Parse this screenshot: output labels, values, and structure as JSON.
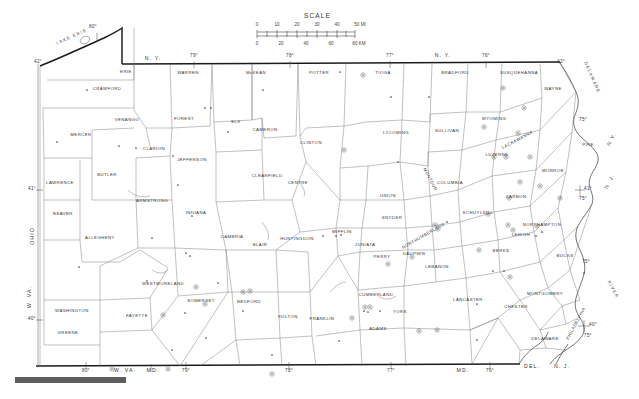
{
  "map": {
    "title": "Pennsylvania County Map",
    "region": "Pennsylvania",
    "scale": {
      "label": "SCALE",
      "miles_ticks": [
        "0",
        "10",
        "20",
        "30",
        "40",
        "50 MI"
      ],
      "km_ticks": [
        "0",
        "20",
        "40",
        "60",
        "80 KM"
      ]
    },
    "water_labels": [
      {
        "name": "LAKE ERIE",
        "x": 72,
        "y": 38,
        "rotate": -24
      },
      {
        "name": "DELAWARE",
        "x": 591,
        "y": 78,
        "rotate": 66
      },
      {
        "name": "RIVER",
        "x": 612,
        "y": 290,
        "rotate": 62
      }
    ],
    "state_labels": [
      {
        "name": "N. Y.",
        "x": 153,
        "y": 60
      },
      {
        "name": "N. Y.",
        "x": 443,
        "y": 57
      },
      {
        "name": "OHIO",
        "x": 34,
        "y": 236,
        "rotate": -90
      },
      {
        "name": "W. VA.",
        "x": 31,
        "y": 297,
        "rotate": -90
      },
      {
        "name": "W. VA.",
        "x": 125,
        "y": 372
      },
      {
        "name": "MD.",
        "x": 153,
        "y": 372
      },
      {
        "name": "MD.",
        "x": 463,
        "y": 372
      },
      {
        "name": "DEL.",
        "x": 532,
        "y": 368
      },
      {
        "name": "N. J.",
        "x": 562,
        "y": 368
      },
      {
        "name": "N.Y.",
        "x": 613,
        "y": 140,
        "rotate": -62
      },
      {
        "name": "N. J.",
        "x": 611,
        "y": 182,
        "rotate": -62
      }
    ],
    "coordinate_labels": [
      {
        "text": "80°",
        "x": 93,
        "y": 28
      },
      {
        "text": "42°",
        "x": 38,
        "y": 63
      },
      {
        "text": "79°",
        "x": 194,
        "y": 57
      },
      {
        "text": "78°",
        "x": 290,
        "y": 57
      },
      {
        "text": "77°",
        "x": 390,
        "y": 57
      },
      {
        "text": "76°",
        "x": 486,
        "y": 57
      },
      {
        "text": "42°",
        "x": 561,
        "y": 63
      },
      {
        "text": "75°",
        "x": 583,
        "y": 121
      },
      {
        "text": "41°",
        "x": 32,
        "y": 190
      },
      {
        "text": "41°",
        "x": 588,
        "y": 190
      },
      {
        "text": "75°",
        "x": 583,
        "y": 200
      },
      {
        "text": "75°",
        "x": 586,
        "y": 263
      },
      {
        "text": "40°",
        "x": 32,
        "y": 320
      },
      {
        "text": "40°",
        "x": 593,
        "y": 326
      },
      {
        "text": "75°",
        "x": 588,
        "y": 337
      },
      {
        "text": "80°",
        "x": 86,
        "y": 372
      },
      {
        "text": "79°",
        "x": 186,
        "y": 372
      },
      {
        "text": "78°",
        "x": 289,
        "y": 372
      },
      {
        "text": "77°",
        "x": 391,
        "y": 372
      },
      {
        "text": "76°",
        "x": 490,
        "y": 372
      }
    ],
    "counties": [
      {
        "name": "ERIE",
        "x": 126,
        "y": 73
      },
      {
        "name": "CRAWFORD",
        "x": 107,
        "y": 90
      },
      {
        "name": "WARREN",
        "x": 188,
        "y": 74
      },
      {
        "name": "McKEAN",
        "x": 256,
        "y": 74
      },
      {
        "name": "POTTER",
        "x": 319,
        "y": 74
      },
      {
        "name": "TIOGA",
        "x": 383,
        "y": 74
      },
      {
        "name": "BRADFORD",
        "x": 455,
        "y": 74
      },
      {
        "name": "SUSQUEHANNA",
        "x": 519,
        "y": 74
      },
      {
        "name": "WAYNE",
        "x": 553,
        "y": 90
      },
      {
        "name": "VENANGO",
        "x": 127,
        "y": 121
      },
      {
        "name": "FOREST",
        "x": 184,
        "y": 120
      },
      {
        "name": "ELK",
        "x": 236,
        "y": 123
      },
      {
        "name": "CAMERON",
        "x": 265,
        "y": 131
      },
      {
        "name": "CLINTON",
        "x": 311,
        "y": 144
      },
      {
        "name": "LYCOMING",
        "x": 396,
        "y": 134
      },
      {
        "name": "SULLIVAN",
        "x": 447,
        "y": 132
      },
      {
        "name": "WYOMING",
        "x": 494,
        "y": 120
      },
      {
        "name": "LACKAWANNA",
        "x": 518,
        "y": 141,
        "rotate": -28
      },
      {
        "name": "PIKE",
        "x": 588,
        "y": 146
      },
      {
        "name": "MERCER",
        "x": 81,
        "y": 136
      },
      {
        "name": "CLARION",
        "x": 154,
        "y": 150
      },
      {
        "name": "JEFFERSON",
        "x": 192,
        "y": 161
      },
      {
        "name": "CLEARFIELD",
        "x": 267,
        "y": 177
      },
      {
        "name": "CENTRE",
        "x": 298,
        "y": 184
      },
      {
        "name": "COLUMBIA",
        "x": 450,
        "y": 184
      },
      {
        "name": "LUZERNE",
        "x": 497,
        "y": 156
      },
      {
        "name": "MONROE",
        "x": 553,
        "y": 172
      },
      {
        "name": "LAWRENCE",
        "x": 60,
        "y": 184
      },
      {
        "name": "BUTLER",
        "x": 107,
        "y": 176
      },
      {
        "name": "ARMSTRONG",
        "x": 152,
        "y": 202
      },
      {
        "name": "INDIANA",
        "x": 196,
        "y": 214
      },
      {
        "name": "UNION",
        "x": 388,
        "y": 197
      },
      {
        "name": "SNYDER",
        "x": 392,
        "y": 219
      },
      {
        "name": "MONTOUR",
        "x": 429,
        "y": 180,
        "rotate": 62
      },
      {
        "name": "NORTHUMBERLAND",
        "x": 424,
        "y": 237,
        "rotate": -30
      },
      {
        "name": "SCHUYLKILL",
        "x": 478,
        "y": 214
      },
      {
        "name": "CARBON",
        "x": 516,
        "y": 198
      },
      {
        "name": "NORTHAMPTON",
        "x": 542,
        "y": 226
      },
      {
        "name": "LEHIGH",
        "x": 521,
        "y": 236
      },
      {
        "name": "BEAVER",
        "x": 63,
        "y": 215
      },
      {
        "name": "ALLEGHENY",
        "x": 100,
        "y": 239
      },
      {
        "name": "CAMBRIA",
        "x": 232,
        "y": 238
      },
      {
        "name": "BLAIR",
        "x": 260,
        "y": 246
      },
      {
        "name": "HUNTINGDON",
        "x": 297,
        "y": 240
      },
      {
        "name": "MIFFLIN",
        "x": 342,
        "y": 233
      },
      {
        "name": "JUNIATA",
        "x": 365,
        "y": 246
      },
      {
        "name": "PERRY",
        "x": 382,
        "y": 258
      },
      {
        "name": "DAUPHIN",
        "x": 414,
        "y": 255
      },
      {
        "name": "LEBANON",
        "x": 437,
        "y": 268
      },
      {
        "name": "BERKS",
        "x": 501,
        "y": 252
      },
      {
        "name": "BUCKS",
        "x": 565,
        "y": 257
      },
      {
        "name": "WESTMORELAND",
        "x": 163,
        "y": 285
      },
      {
        "name": "SOMERSET",
        "x": 201,
        "y": 302
      },
      {
        "name": "BEDFORD",
        "x": 249,
        "y": 303
      },
      {
        "name": "FULTON",
        "x": 288,
        "y": 318
      },
      {
        "name": "FRANKLIN",
        "x": 322,
        "y": 320
      },
      {
        "name": "CUMBERLAND",
        "x": 376,
        "y": 296
      },
      {
        "name": "YORK",
        "x": 400,
        "y": 313
      },
      {
        "name": "ADAMS",
        "x": 378,
        "y": 330
      },
      {
        "name": "LANCASTER",
        "x": 468,
        "y": 301
      },
      {
        "name": "MONTGOMERY",
        "x": 545,
        "y": 295
      },
      {
        "name": "CHESTER",
        "x": 516,
        "y": 308
      },
      {
        "name": "DELAWARE",
        "x": 545,
        "y": 340
      },
      {
        "name": "PHILADELPHIA",
        "x": 577,
        "y": 324,
        "rotate": -62
      },
      {
        "name": "WASHINGTON",
        "x": 72,
        "y": 312
      },
      {
        "name": "GREENE",
        "x": 68,
        "y": 334
      },
      {
        "name": "FAYETTE",
        "x": 137,
        "y": 317
      }
    ],
    "point_symbols": {
      "plain_dots": [
        [
          87,
          90
        ],
        [
          57,
          142
        ],
        [
          119,
          146
        ],
        [
          136,
          148
        ],
        [
          205,
          108
        ],
        [
          211,
          108
        ],
        [
          228,
          132
        ],
        [
          173,
          156
        ],
        [
          178,
          185
        ],
        [
          341,
          63
        ],
        [
          340,
          72
        ],
        [
          391,
          97
        ],
        [
          429,
          97
        ],
        [
          263,
          90
        ],
        [
          398,
          162
        ],
        [
          192,
          216
        ],
        [
          186,
          253
        ],
        [
          190,
          256
        ],
        [
          323,
          236
        ],
        [
          336,
          236
        ],
        [
          341,
          235
        ],
        [
          79,
          267
        ],
        [
          152,
          238
        ],
        [
          147,
          281
        ],
        [
          218,
          283
        ],
        [
          243,
          311
        ],
        [
          364,
          311
        ],
        [
          368,
          312
        ],
        [
          380,
          311
        ],
        [
          493,
          271
        ],
        [
          504,
          271
        ],
        [
          477,
          304
        ],
        [
          477,
          340
        ],
        [
          339,
          341
        ],
        [
          172,
          350
        ],
        [
          272,
          355
        ],
        [
          185,
          313
        ],
        [
          447,
          222
        ],
        [
          206,
          338
        ],
        [
          536,
          236
        ],
        [
          542,
          232
        ],
        [
          584,
          273
        ]
      ],
      "ringed_dots": [
        [
          363,
          75
        ],
        [
          503,
          88
        ],
        [
          524,
          108
        ],
        [
          518,
          133
        ],
        [
          344,
          150
        ],
        [
          484,
          127
        ],
        [
          494,
          157
        ],
        [
          506,
          157
        ],
        [
          530,
          157
        ],
        [
          540,
          186
        ],
        [
          520,
          182
        ],
        [
          509,
          198
        ],
        [
          560,
          198
        ],
        [
          488,
          214
        ],
        [
          435,
          225
        ],
        [
          438,
          229
        ],
        [
          508,
          225
        ],
        [
          513,
          230
        ],
        [
          479,
          250
        ],
        [
          412,
          257
        ],
        [
          388,
          264
        ],
        [
          196,
          287
        ],
        [
          205,
          304
        ],
        [
          243,
          292
        ],
        [
          250,
          291
        ],
        [
          163,
          315
        ],
        [
          365,
          307
        ],
        [
          370,
          307
        ],
        [
          352,
          318
        ],
        [
          419,
          331
        ],
        [
          437,
          330
        ],
        [
          112,
          369
        ],
        [
          168,
          369
        ],
        [
          272,
          374
        ],
        [
          510,
          277
        ],
        [
          537,
          226
        ]
      ]
    }
  }
}
